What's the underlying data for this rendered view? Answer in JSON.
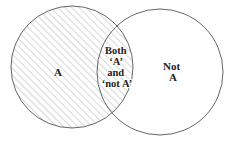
{
  "diagram": {
    "type": "venn",
    "sets": [
      {
        "id": "A",
        "label": "A",
        "hatched": true,
        "center": [
          72,
          67
        ],
        "radius": 61
      },
      {
        "id": "notA",
        "label_lines": [
          "Not",
          "A"
        ],
        "hatched": false,
        "center": [
          160,
          72
        ],
        "radius": 63
      }
    ],
    "intersection": {
      "label_lines": [
        "Both",
        "‘A’",
        "and",
        "‘not A’"
      ],
      "hatched": true
    },
    "colors": {
      "outline": "#666666",
      "hatch": "#b8b8b8",
      "text": "#222222",
      "background": "#ffffff"
    }
  }
}
